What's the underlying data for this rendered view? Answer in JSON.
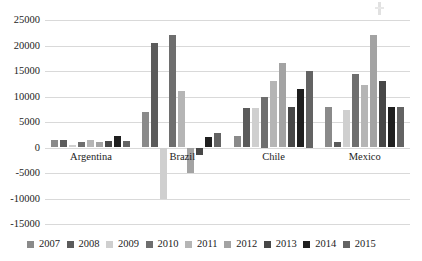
{
  "chart_data": {
    "type": "bar",
    "title": "",
    "xlabel": "",
    "ylabel": "",
    "categories": [
      "Argentina",
      "Brazil",
      "Chile",
      "Mexico"
    ],
    "series": [
      {
        "name": "2007",
        "color": "#8a8a8a",
        "values": [
          1500,
          7000,
          2200,
          8000
        ]
      },
      {
        "name": "2008",
        "color": "#5b5b5b",
        "values": [
          1500,
          20500,
          7800,
          1000
        ]
      },
      {
        "name": "2009",
        "color": "#cfcfcf",
        "values": [
          500,
          -10000,
          7800,
          7400
        ]
      },
      {
        "name": "2010",
        "color": "#6e6e6e",
        "values": [
          1100,
          22000,
          10000,
          14500
        ]
      },
      {
        "name": "2011",
        "color": "#b5b5b5",
        "values": [
          1500,
          11000,
          13000,
          12300
        ]
      },
      {
        "name": "2012",
        "color": "#a3a3a3",
        "values": [
          1000,
          -5000,
          16500,
          22000
        ]
      },
      {
        "name": "2013",
        "color": "#474747",
        "values": [
          1200,
          -1500,
          8000,
          13000
        ]
      },
      {
        "name": "2014",
        "color": "#1f1f1f",
        "values": [
          2200,
          2000,
          11500,
          8000
        ]
      },
      {
        "name": "2015",
        "color": "#636363",
        "values": [
          1300,
          2800,
          15000,
          7900
        ]
      }
    ],
    "ylim": [
      -15000,
      25000
    ],
    "ytick_step": 5000,
    "yticks": [
      "25000",
      "20000",
      "15000",
      "10000",
      "5000",
      "0",
      "-5000",
      "-10000",
      "-15000"
    ],
    "grid": true,
    "legend_position": "bottom"
  }
}
